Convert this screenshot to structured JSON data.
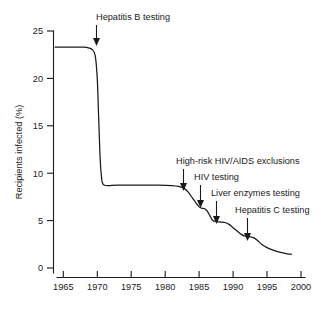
{
  "chart_data": {
    "type": "line",
    "title": "",
    "subtitle": "",
    "xlabel": "",
    "ylabel": "Recipients infected (%)",
    "xlim": [
      1963,
      2000
    ],
    "ylim": [
      0,
      25
    ],
    "grid": false,
    "legend": "none",
    "x_ticks": [
      "1965",
      "1970",
      "1975",
      "1980",
      "1985",
      "1990",
      "1995",
      "2000"
    ],
    "x_tick_values": [
      1965,
      1970,
      1975,
      1980,
      1985,
      1990,
      1995,
      2000
    ],
    "y_ticks": [
      "0",
      "5",
      "10",
      "15",
      "20",
      "25"
    ],
    "y_tick_values": [
      0,
      5,
      10,
      15,
      20,
      25
    ],
    "series": [
      {
        "name": "Recipients infected",
        "x": [
          1963.8,
          1965,
          1966,
          1967,
          1968,
          1968.8,
          1969.3,
          1969.7,
          1970.0,
          1970.2,
          1970.4,
          1970.6,
          1971,
          1973,
          1976,
          1979,
          1981,
          1982,
          1982.8,
          1983.4,
          1984,
          1984.5,
          1985,
          1985.4,
          1985.8,
          1986.2,
          1986.6,
          1987,
          1987.6,
          1988.2,
          1988.8,
          1989.4,
          1990,
          1990.6,
          1991.2,
          1991.8,
          1992.4,
          1993,
          1993.6,
          1994.2,
          1995,
          1996,
          1997,
          1998,
          1998.6
        ],
        "y": [
          23.3,
          23.3,
          23.3,
          23.3,
          23.3,
          23.2,
          23.0,
          22.4,
          20.0,
          16.0,
          12.0,
          9.8,
          8.75,
          8.75,
          8.75,
          8.75,
          8.7,
          8.6,
          8.4,
          8.0,
          7.4,
          6.9,
          6.45,
          6.3,
          6.25,
          6.0,
          5.5,
          5.0,
          4.9,
          4.85,
          4.8,
          4.6,
          4.25,
          3.9,
          3.55,
          3.35,
          3.3,
          3.2,
          2.9,
          2.5,
          2.15,
          1.85,
          1.65,
          1.5,
          1.45
        ]
      }
    ],
    "annotations": [
      {
        "label": "Hepatitis B testing",
        "text_x": 96,
        "text_y": 20,
        "arrow_x": 96,
        "arrow_y_start": 25,
        "arrow_y_end": 45
      },
      {
        "label": "High-risk HIV/AIDS exclusions",
        "text_x": 176,
        "text_y": 164,
        "arrow_x": 183,
        "arrow_y_start": 169,
        "arrow_y_end": 190
      },
      {
        "label": "HIV testing",
        "text_x": 194,
        "text_y": 180,
        "arrow_x": 200,
        "arrow_y_start": 185,
        "arrow_y_end": 207
      },
      {
        "label": "Liver enzymes testing",
        "text_x": 211,
        "text_y": 196,
        "arrow_x": 216,
        "arrow_y_start": 201,
        "arrow_y_end": 223
      },
      {
        "label": "Hepatitis C testing",
        "text_x": 235,
        "text_y": 213,
        "arrow_x": 247,
        "arrow_y_start": 218,
        "arrow_y_end": 240
      }
    ],
    "colors": {
      "curve": "#1a1a1a",
      "axis": "#1a1a1a",
      "text": "#1a1a1a",
      "background": "#ffffff"
    }
  }
}
